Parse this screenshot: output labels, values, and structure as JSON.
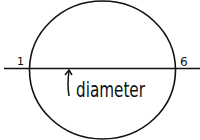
{
  "diagram": {
    "shape": "circle",
    "line": "horizontal line through center",
    "labels": {
      "left_end": "1",
      "right_end": "6",
      "annotation": "diameter"
    },
    "colors": {
      "stroke": "#111111",
      "background": "#ffffff"
    }
  }
}
